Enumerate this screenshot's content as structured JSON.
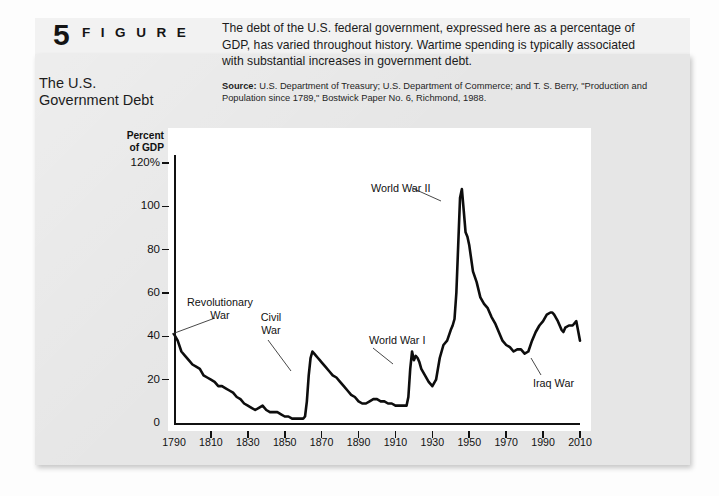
{
  "figure": {
    "number": "5",
    "word": "F I G U R E",
    "title_line1": "The U.S.",
    "title_line2": "Government Debt",
    "description": "The debt of the U.S. federal government, expressed here as a percentage of GDP, has varied throughout history. Wartime spending is typically associated with substantial increases in government debt.",
    "source_label": "Source:",
    "source_text": "U.S. Department of Treasury; U.S. Department of Commerce; and T. S. Berry, \"Production and Population since 1789,\" Bostwick Paper No. 6, Richmond, 1988."
  },
  "colors": {
    "panel": "#e6e6e6",
    "topband": "#f2f2f2",
    "plot_background": "#ffffff",
    "line": "#0d0d0d",
    "text": "#111111"
  },
  "chart_data": {
    "type": "line",
    "title": "The U.S. Government Debt",
    "xlabel": "",
    "ylabel": "Percent of GDP",
    "ylabel_line1": "Percent",
    "ylabel_line2": "of GDP",
    "grid": false,
    "legend": "none",
    "xlim": [
      1790,
      2010
    ],
    "ylim": [
      0,
      120
    ],
    "ytick_labels": [
      "0",
      "20",
      "40",
      "60",
      "80",
      "100",
      "120%"
    ],
    "ytick_values": [
      0,
      20,
      40,
      60,
      80,
      100,
      120
    ],
    "xtick_labels": [
      "1790",
      "1810",
      "1830",
      "1850",
      "1870",
      "1890",
      "1910",
      "1930",
      "1950",
      "1970",
      "1990",
      "2010"
    ],
    "xtick_values": [
      1790,
      1810,
      1830,
      1850,
      1870,
      1890,
      1910,
      1930,
      1950,
      1970,
      1990,
      2010
    ],
    "series": [
      {
        "name": "Federal debt as percent of GDP",
        "x": [
          1790,
          1792,
          1794,
          1796,
          1798,
          1800,
          1802,
          1804,
          1806,
          1808,
          1810,
          1812,
          1814,
          1816,
          1818,
          1820,
          1822,
          1824,
          1826,
          1828,
          1830,
          1832,
          1834,
          1836,
          1838,
          1840,
          1842,
          1844,
          1846,
          1848,
          1850,
          1852,
          1854,
          1856,
          1858,
          1860,
          1861,
          1862,
          1863,
          1864,
          1865,
          1866,
          1867,
          1868,
          1869,
          1870,
          1872,
          1874,
          1876,
          1878,
          1880,
          1882,
          1884,
          1886,
          1888,
          1890,
          1892,
          1894,
          1896,
          1898,
          1900,
          1902,
          1904,
          1906,
          1908,
          1910,
          1912,
          1914,
          1916,
          1917,
          1918,
          1919,
          1920,
          1921,
          1922,
          1923,
          1924,
          1926,
          1928,
          1930,
          1932,
          1934,
          1936,
          1938,
          1940,
          1941,
          1942,
          1943,
          1944,
          1945,
          1946,
          1947,
          1948,
          1949,
          1950,
          1952,
          1954,
          1956,
          1958,
          1960,
          1962,
          1964,
          1966,
          1968,
          1970,
          1972,
          1974,
          1976,
          1978,
          1980,
          1982,
          1984,
          1986,
          1988,
          1990,
          1992,
          1994,
          1995,
          1996,
          1998,
          2000,
          2001,
          2002,
          2004,
          2006,
          2008,
          2010
        ],
        "y": [
          41,
          38,
          33,
          31,
          29,
          27,
          26,
          25,
          22,
          21,
          20,
          19,
          17,
          17,
          16,
          15,
          14,
          12,
          11,
          9,
          8,
          7,
          6,
          7,
          8,
          6,
          5,
          5,
          5,
          4,
          3,
          3,
          2,
          2,
          2,
          2,
          3,
          10,
          22,
          30,
          33,
          32,
          31,
          30,
          29,
          28,
          26,
          24,
          22,
          21,
          19,
          17,
          15,
          13,
          12,
          10,
          9,
          9,
          10,
          11,
          11,
          10,
          10,
          9,
          9,
          8,
          8,
          8,
          8,
          12,
          25,
          33,
          29,
          31,
          30,
          28,
          25,
          22,
          19,
          17,
          20,
          30,
          36,
          38,
          43,
          45,
          48,
          60,
          82,
          104,
          108,
          98,
          88,
          86,
          82,
          70,
          65,
          58,
          55,
          53,
          49,
          46,
          42,
          38,
          36,
          35,
          33,
          34,
          34,
          32,
          33,
          38,
          42,
          45,
          47,
          50,
          51,
          51,
          50,
          47,
          43,
          42,
          44,
          45,
          45,
          47,
          38
        ],
        "note": "Federal debt held as percent of GDP, 1790-2010; estimated from plotted curve"
      }
    ],
    "annotations": [
      {
        "label": "Revolutionary\nWar",
        "line1": "Revolutionary",
        "line2": "War",
        "x": 1790,
        "y": 41
      },
      {
        "label": "Civil\nWar",
        "line1": "Civil",
        "line2": "War",
        "x": 1864,
        "y": 33
      },
      {
        "label": "World War I",
        "line1": "World War I",
        "line2": "",
        "x": 1919,
        "y": 33
      },
      {
        "label": "World War II",
        "line1": "World War II",
        "line2": "",
        "x": 1946,
        "y": 108
      },
      {
        "label": "Iraq War",
        "line1": "Iraq War",
        "line2": "",
        "x": 2004,
        "y": 44
      }
    ]
  }
}
